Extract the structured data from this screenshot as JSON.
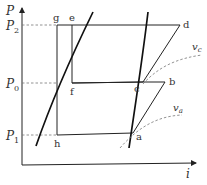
{
  "diagram": {
    "type": "pressure-enthalpy (P-i) refrigeration cycle diagram",
    "axes": {
      "y_label": "P",
      "x_label": "i"
    },
    "pressure_levels": [
      {
        "id": "P2",
        "label": "P",
        "sub": "2"
      },
      {
        "id": "P0",
        "label": "P",
        "sub": "0"
      },
      {
        "id": "P1",
        "label": "P",
        "sub": "1"
      }
    ],
    "points": {
      "g": "g",
      "e": "e",
      "d": "d",
      "f": "f",
      "c": "c",
      "b": "b",
      "h": "h",
      "a": "a"
    },
    "isochores": [
      {
        "id": "vc",
        "label": "v",
        "sub": "c"
      },
      {
        "id": "va",
        "label": "v",
        "sub": "a"
      }
    ],
    "colors": {
      "line": "#222222",
      "dashed": "#777777",
      "text": "#333333"
    }
  }
}
